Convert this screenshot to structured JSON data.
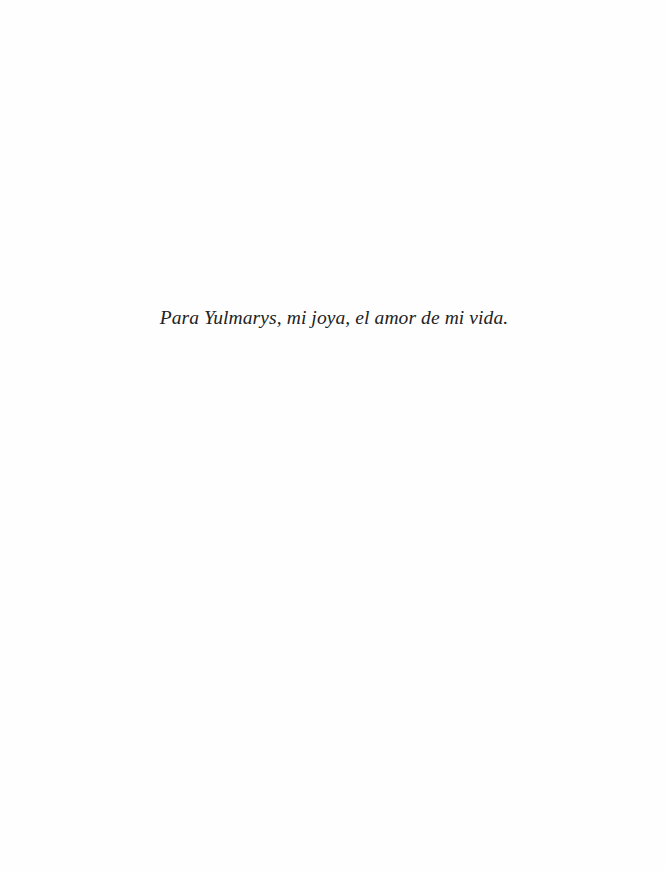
{
  "page": {
    "dedication": "Para Yulmarys, mi joya, el amor de mi vida."
  },
  "colors": {
    "background": "#fefefe",
    "text": "#222222"
  }
}
